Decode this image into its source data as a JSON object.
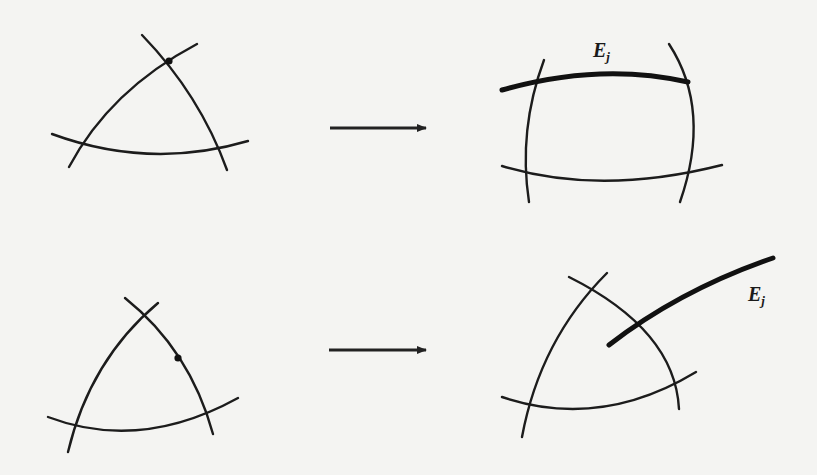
{
  "figure": {
    "type": "blow-up diagram",
    "rows": [
      {
        "name": "top",
        "before": {
          "description": "three curves forming a triangle, marked intersection point at top vertex",
          "marked_point": "vertex"
        },
        "after": {
          "description": "point blown up into exceptional curve E_j (thick)",
          "exceptional_label": "E",
          "exceptional_subscript": "j"
        }
      },
      {
        "name": "bottom",
        "before": {
          "description": "three curves forming a triangle, marked point on right edge",
          "marked_point": "edge"
        },
        "after": {
          "description": "exceptional curve E_j (thick) crossing right edge",
          "exceptional_label": "E",
          "exceptional_subscript": "j"
        }
      }
    ],
    "arrows": [
      "top-arrow",
      "bottom-arrow"
    ],
    "colors": {
      "ink": "#1c1c1c",
      "paper": "#f4f4f2"
    }
  },
  "labels": {
    "top_label_main": "E",
    "top_label_sub": "j",
    "bottom_label_main": "E",
    "bottom_label_sub": "j"
  }
}
